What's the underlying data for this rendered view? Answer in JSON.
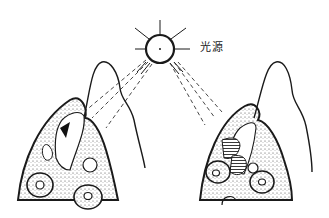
{
  "diagram": {
    "light_source_label": "光源",
    "colors": {
      "ink": "#1a1a1a",
      "background": "#ffffff",
      "stipple": "#555555"
    },
    "elements": [
      {
        "id": "light-source",
        "type": "sun",
        "label": "光源"
      },
      {
        "id": "organism-left",
        "type": "cell",
        "description": "organism with eyespot, light rays reaching flagellum base"
      },
      {
        "id": "organism-right",
        "type": "cell",
        "description": "organism with shaded eyespot, light rays blocked"
      }
    ]
  }
}
